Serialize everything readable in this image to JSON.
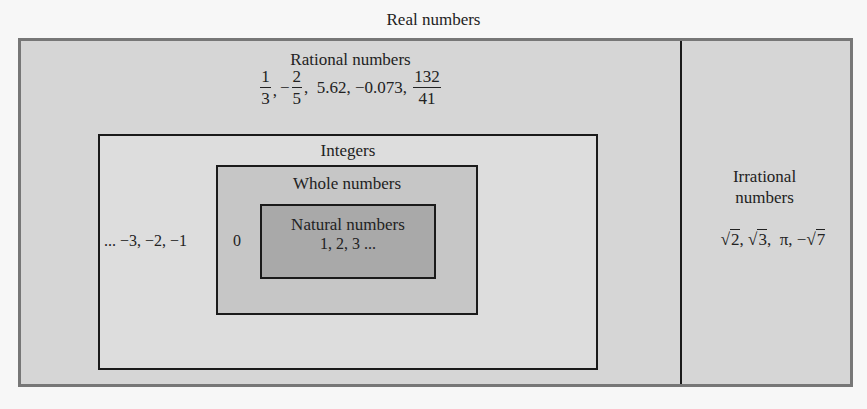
{
  "diagram": {
    "title": "Real numbers",
    "colors": {
      "outer_border": "#777777",
      "real_fill": "#d6d6d6",
      "integers_fill": "#dddddd",
      "whole_fill": "#c6c6c6",
      "natural_fill": "#a9a9a9",
      "line": "#1a1a1a"
    },
    "rational": {
      "label": "Rational numbers",
      "examples": {
        "frac1": {
          "num": "1",
          "den": "3"
        },
        "sep1": ",",
        "neg_sign": "−",
        "frac2": {
          "num": "2",
          "den": "5"
        },
        "middle": ",  5.62, −0.073, ",
        "frac3": {
          "num": "132",
          "den": "41"
        }
      }
    },
    "integers": {
      "label": "Integers",
      "negatives": "... −3, −2, −1"
    },
    "whole": {
      "label": "Whole numbers",
      "zero": "0"
    },
    "natural": {
      "label": "Natural numbers",
      "values": "1, 2, 3 ..."
    },
    "irrational": {
      "label_line1": "Irrational",
      "label_line2": "numbers",
      "examples": {
        "sqrt_symbol": "√",
        "r1": "2",
        "sep1": ", ",
        "r2": "3",
        "sep2": ",  π, −",
        "r3": "7"
      }
    }
  }
}
